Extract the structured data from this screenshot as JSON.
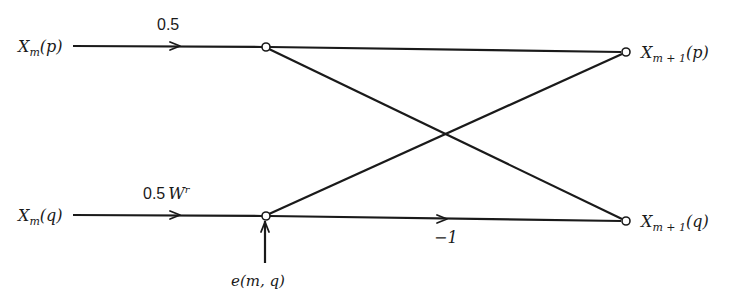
{
  "diagram": {
    "type": "butterfly-flow-graph",
    "inputs": {
      "top": {
        "base": "X",
        "sub": "m",
        "arg": "(p)"
      },
      "bottom": {
        "base": "X",
        "sub": "m",
        "arg": "(q)"
      }
    },
    "outputs": {
      "top": {
        "base": "X",
        "sub": "m + 1",
        "arg": "(p)"
      },
      "bottom": {
        "base": "X",
        "sub": "m + 1",
        "arg": "(q)"
      }
    },
    "gains": {
      "top_input": "0.5",
      "bottom_input_coeff": "0.5",
      "bottom_input_twiddle": "W",
      "bottom_input_twiddle_exp": "r",
      "bottom_horizontal": "−1"
    },
    "error_input": "e(m, q)",
    "colors": {
      "ink": "#1a1a1a",
      "background": "#ffffff"
    }
  }
}
